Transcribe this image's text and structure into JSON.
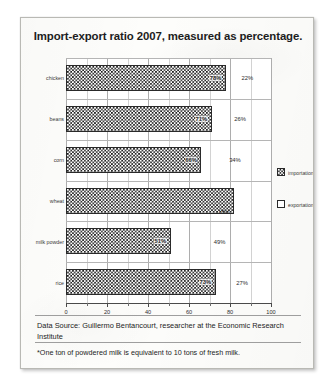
{
  "chart_data": {
    "type": "bar",
    "orientation": "horizontal",
    "stacked": true,
    "title": "Import-export ratio 2007, measured as percentage.",
    "xlabel": "",
    "ylabel": "",
    "xlim": [
      0,
      100
    ],
    "xticks": [
      0,
      20,
      40,
      60,
      80,
      100
    ],
    "xtick_labels": [
      "0",
      "20",
      "40",
      "60",
      "80",
      "100"
    ],
    "minor_tick_step": 10,
    "grid": true,
    "legend_position": "right",
    "categories": [
      "chicken",
      "beans",
      "corn",
      "wheat",
      "milk powder",
      "rice"
    ],
    "series": [
      {
        "name": "importation",
        "pattern": "checkerboard",
        "values": [
          78,
          71,
          66,
          82,
          51,
          73
        ],
        "labels": [
          "78%",
          "71%",
          "66%",
          "",
          "51%",
          "73%"
        ]
      },
      {
        "name": "exportation",
        "pattern": "solid-white",
        "values": [
          22,
          26,
          34,
          18,
          49,
          27
        ],
        "labels": [
          "22%",
          "26%",
          "34%",
          "18%",
          "49%",
          "27%"
        ]
      }
    ]
  },
  "legend": {
    "items": [
      {
        "label": "importation",
        "swatch": "checkerboard"
      },
      {
        "label": "exportation",
        "swatch": "white"
      }
    ]
  },
  "footer": {
    "source": "Data Source: Guillermo Bentancourt, researcher at the Economic Research Institute",
    "footnote": "*One ton of powdered milk is equivalent to 10 tons of fresh milk."
  }
}
